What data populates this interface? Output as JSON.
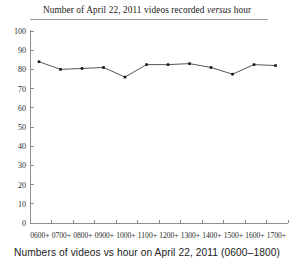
{
  "title": {
    "prefix": "Number of April 22, 2011 videos recorded ",
    "emphasis": "versus",
    "suffix": " hour"
  },
  "caption": "Numbers of videos vs hour on April 22, 2011 (0600–1800)",
  "colors": {
    "line": "#2b2b2b",
    "marker": "#151515",
    "axis": "#8d8d8d",
    "text": "#1f1f1f",
    "background": "#ffffff",
    "rule": "#9a9a9a"
  },
  "chart_data": {
    "type": "line",
    "title": "Number of April 22, 2011 videos recorded versus hour",
    "xlabel": "Numbers of videos vs hour on April 22, 2011 (0600–1800)",
    "ylabel": "",
    "categories": [
      "0600+",
      "0700+",
      "0800+",
      "0900+",
      "1000+",
      "1100+",
      "1200+",
      "1300+",
      "1400+",
      "1500+",
      "1600+",
      "1700+"
    ],
    "values": [
      84,
      80,
      80.5,
      81,
      76,
      82.5,
      82.5,
      83,
      81,
      77.5,
      82.5,
      82
    ],
    "ylim": [
      0,
      100
    ],
    "yticks": [
      0,
      10,
      20,
      30,
      40,
      50,
      60,
      70,
      80,
      90,
      100
    ],
    "ytick_labels": [
      "0",
      "10",
      "20",
      "30",
      "40",
      "50",
      "60",
      "70",
      "80",
      "90",
      "100"
    ],
    "grid": false,
    "legend": false,
    "marker": "square",
    "series": [
      {
        "name": "videos recorded",
        "values": [
          84,
          80,
          80.5,
          81,
          76,
          82.5,
          82.5,
          83,
          81,
          77.5,
          82.5,
          82
        ]
      }
    ]
  }
}
